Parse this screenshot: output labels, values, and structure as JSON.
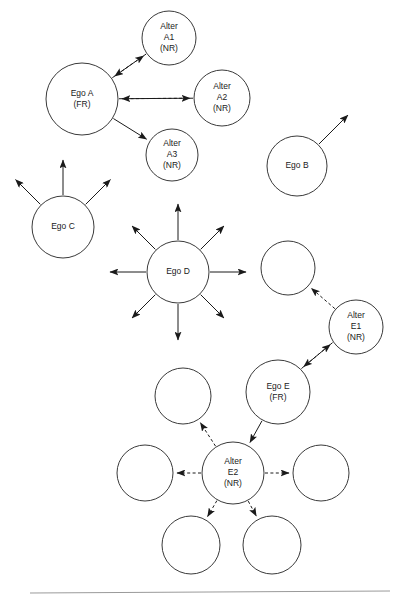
{
  "figure": {
    "background_color": "#ffffff",
    "node_stroke_color": "#3a3a3a",
    "edge_color": "#1a1a1a",
    "footer_rule_color": "#9a9a9a"
  },
  "legend_codes": {
    "fr": "(FR)",
    "nr": "(NR)"
  },
  "nodes": [
    {
      "id": "alter-a1",
      "lines": [
        "Alter",
        "A1",
        "(NR)"
      ],
      "cx": 169,
      "cy": 38,
      "r": 27,
      "labeled": true
    },
    {
      "id": "ego-a",
      "lines": [
        "Ego A",
        "(FR)"
      ],
      "cx": 82,
      "cy": 99,
      "r": 36,
      "labeled": true
    },
    {
      "id": "alter-a2",
      "lines": [
        "Alter",
        "A2",
        "(NR)"
      ],
      "cx": 222,
      "cy": 98,
      "r": 28,
      "labeled": true
    },
    {
      "id": "alter-a3",
      "lines": [
        "Alter",
        "A3",
        "(NR)"
      ],
      "cx": 172,
      "cy": 155,
      "r": 26,
      "labeled": true
    },
    {
      "id": "ego-b",
      "lines": [
        "Ego B"
      ],
      "cx": 297,
      "cy": 166,
      "r": 30,
      "labeled": true
    },
    {
      "id": "ego-c",
      "lines": [
        "Ego C"
      ],
      "cx": 63,
      "cy": 227,
      "r": 31,
      "labeled": true
    },
    {
      "id": "ego-d",
      "lines": [
        "Ego D"
      ],
      "cx": 178,
      "cy": 272,
      "r": 31,
      "labeled": true
    },
    {
      "id": "empty-e1-upper",
      "lines": [],
      "cx": 288,
      "cy": 268,
      "r": 27,
      "labeled": false
    },
    {
      "id": "alter-e1",
      "lines": [
        "Alter",
        "E1",
        "(NR)"
      ],
      "cx": 356,
      "cy": 327,
      "r": 27,
      "labeled": true
    },
    {
      "id": "ego-e",
      "lines": [
        "Ego E",
        "(FR)"
      ],
      "cx": 278,
      "cy": 392,
      "r": 32,
      "labeled": true
    },
    {
      "id": "empty-e2-upleft",
      "lines": [],
      "cx": 183,
      "cy": 396,
      "r": 28,
      "labeled": false
    },
    {
      "id": "empty-e2-left",
      "lines": [],
      "cx": 145,
      "cy": 473,
      "r": 28,
      "labeled": false
    },
    {
      "id": "alter-e2",
      "lines": [
        "Alter",
        "E2",
        "(NR)"
      ],
      "cx": 233,
      "cy": 473,
      "r": 31,
      "labeled": true
    },
    {
      "id": "empty-e2-right",
      "lines": [],
      "cx": 321,
      "cy": 473,
      "r": 28,
      "labeled": false
    },
    {
      "id": "empty-e2-downleft",
      "lines": [],
      "cx": 191,
      "cy": 545,
      "r": 29,
      "labeled": false
    },
    {
      "id": "empty-e2-downright",
      "lines": [],
      "cx": 272,
      "cy": 545,
      "r": 29,
      "labeled": false
    }
  ],
  "edges": [
    {
      "id": "ego-a-to-alter-a1",
      "from": "ego-a",
      "to": "alter-a1",
      "style": "solid",
      "arrow": "end"
    },
    {
      "id": "alter-a1-to-ego-a",
      "from": "alter-a1",
      "to": "ego-a",
      "style": "dashed",
      "arrow": "end"
    },
    {
      "id": "ego-a-to-alter-a2",
      "from": "ego-a",
      "to": "alter-a2",
      "style": "solid",
      "arrow": "end"
    },
    {
      "id": "alter-a2-to-ego-a",
      "from": "alter-a2",
      "to": "ego-a",
      "style": "dashed",
      "arrow": "end"
    },
    {
      "id": "ego-a-to-alter-a3",
      "from": "ego-a",
      "to": "alter-a3",
      "style": "solid",
      "arrow": "end"
    },
    {
      "id": "ego-b-out-1",
      "from": "ego-b",
      "to": "free",
      "style": "solid",
      "arrow": "end",
      "angle": -45,
      "length": 42
    },
    {
      "id": "ego-c-out-1",
      "from": "ego-c",
      "to": "free",
      "style": "solid",
      "arrow": "end",
      "angle": -135,
      "length": 36
    },
    {
      "id": "ego-c-out-2",
      "from": "ego-c",
      "to": "free",
      "style": "solid",
      "arrow": "end",
      "angle": -90,
      "length": 36
    },
    {
      "id": "ego-c-out-3",
      "from": "ego-c",
      "to": "free",
      "style": "solid",
      "arrow": "end",
      "angle": -45,
      "length": 36
    },
    {
      "id": "ego-d-out-1",
      "from": "ego-d",
      "to": "free",
      "style": "solid",
      "arrow": "end",
      "angle": -90,
      "length": 37
    },
    {
      "id": "ego-d-out-2",
      "from": "ego-d",
      "to": "free",
      "style": "solid",
      "arrow": "end",
      "angle": -45,
      "length": 34
    },
    {
      "id": "ego-d-out-3",
      "from": "ego-d",
      "to": "free",
      "style": "solid",
      "arrow": "end",
      "angle": 0,
      "length": 37
    },
    {
      "id": "ego-d-out-4",
      "from": "ego-d",
      "to": "free",
      "style": "solid",
      "arrow": "end",
      "angle": 45,
      "length": 34
    },
    {
      "id": "ego-d-out-5",
      "from": "ego-d",
      "to": "free",
      "style": "solid",
      "arrow": "end",
      "angle": 90,
      "length": 37
    },
    {
      "id": "ego-d-out-6",
      "from": "ego-d",
      "to": "free",
      "style": "solid",
      "arrow": "end",
      "angle": 135,
      "length": 34
    },
    {
      "id": "ego-d-out-7",
      "from": "ego-d",
      "to": "free",
      "style": "solid",
      "arrow": "end",
      "angle": 180,
      "length": 37
    },
    {
      "id": "ego-d-out-8",
      "from": "ego-d",
      "to": "free",
      "style": "solid",
      "arrow": "end",
      "angle": -135,
      "length": 34
    },
    {
      "id": "alter-e1-to-empty-upper",
      "from": "alter-e1",
      "to": "empty-e1-upper",
      "style": "dashed",
      "arrow": "end"
    },
    {
      "id": "alter-e1-to-ego-e",
      "from": "alter-e1",
      "to": "ego-e",
      "style": "dashed",
      "arrow": "end",
      "offset": 3
    },
    {
      "id": "ego-e-to-alter-e1",
      "from": "ego-e",
      "to": "alter-e1",
      "style": "solid",
      "arrow": "end",
      "offset": -3
    },
    {
      "id": "ego-e-to-alter-e2",
      "from": "ego-e",
      "to": "alter-e2",
      "style": "solid",
      "arrow": "end"
    },
    {
      "id": "alter-e2-to-empty-upleft",
      "from": "alter-e2",
      "to": "empty-e2-upleft",
      "style": "dashed",
      "arrow": "end"
    },
    {
      "id": "alter-e2-to-empty-left",
      "from": "alter-e2",
      "to": "empty-e2-left",
      "style": "dashed",
      "arrow": "end"
    },
    {
      "id": "alter-e2-to-empty-right",
      "from": "alter-e2",
      "to": "empty-e2-right",
      "style": "dashed",
      "arrow": "end"
    },
    {
      "id": "alter-e2-to-empty-downleft",
      "from": "alter-e2",
      "to": "empty-e2-downleft",
      "style": "dashed",
      "arrow": "end"
    },
    {
      "id": "alter-e2-to-empty-downright",
      "from": "alter-e2",
      "to": "empty-e2-downright",
      "style": "dashed",
      "arrow": "end"
    }
  ],
  "footer_rule": {
    "x1": 30,
    "y1": 593,
    "x2": 390,
    "y2": 591
  }
}
